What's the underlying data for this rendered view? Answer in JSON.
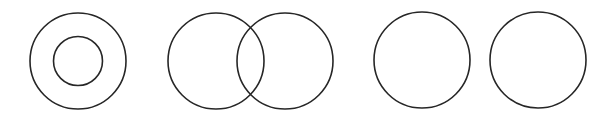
{
  "canvas": {
    "width": 615,
    "height": 119,
    "background": "#ffffff"
  },
  "style": {
    "stroke_color": "#262626",
    "stroke_width": 1.6
  },
  "diagrams": [
    {
      "name": "concentric-circles",
      "relation": "containment",
      "circles": [
        {
          "cx": 78,
          "cy": 61,
          "r": 48
        },
        {
          "cx": 78,
          "cy": 61,
          "r": 24.5
        }
      ]
    },
    {
      "name": "overlapping-circles",
      "relation": "intersection",
      "circles": [
        {
          "cx": 216,
          "cy": 61,
          "r": 48
        },
        {
          "cx": 285,
          "cy": 61,
          "r": 48
        }
      ]
    },
    {
      "name": "disjoint-circles",
      "relation": "disjoint",
      "circles": [
        {
          "cx": 422,
          "cy": 60,
          "r": 48
        },
        {
          "cx": 538,
          "cy": 60,
          "r": 48
        }
      ]
    }
  ]
}
